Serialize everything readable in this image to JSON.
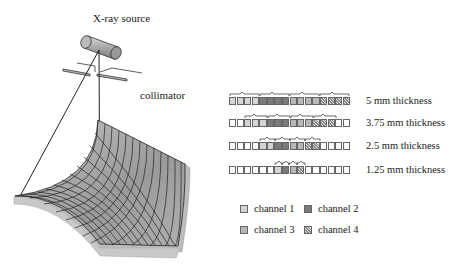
{
  "labels": {
    "source": "X-ray source",
    "collimator": "collimator"
  },
  "rows": [
    {
      "label": "5 mm thickness",
      "cells": [
        1,
        1,
        1,
        1,
        2,
        2,
        2,
        2,
        3,
        3,
        3,
        3,
        4,
        4,
        4,
        4
      ],
      "brace_cells": 4
    },
    {
      "label": "3.75 mm thickness",
      "cells": [
        0,
        0,
        1,
        1,
        1,
        2,
        2,
        2,
        3,
        3,
        3,
        4,
        4,
        4,
        0,
        0
      ],
      "brace_cells": 3
    },
    {
      "label": "2.5 mm thickness",
      "cells": [
        0,
        0,
        0,
        0,
        1,
        1,
        2,
        2,
        3,
        3,
        4,
        4,
        0,
        0,
        0,
        0
      ],
      "brace_cells": 2
    },
    {
      "label": "1.25 mm thickness",
      "cells": [
        0,
        0,
        0,
        0,
        0,
        0,
        1,
        2,
        3,
        4,
        0,
        0,
        0,
        0,
        0,
        0
      ],
      "brace_cells": 1
    }
  ],
  "legend": [
    {
      "label": "channel 1",
      "swatch": "c1"
    },
    {
      "label": "channel 2",
      "swatch": "c2"
    },
    {
      "label": "channel 3",
      "swatch": "c3"
    },
    {
      "label": "channel 4",
      "swatch": "c4"
    }
  ],
  "colors": {
    "channel1": "#d4d4d4",
    "channel2": "#7a7a7a",
    "channel3": "#b8b8b8",
    "channel4": "hatched",
    "empty": "#ffffff",
    "detector": "#a0a0a0"
  }
}
